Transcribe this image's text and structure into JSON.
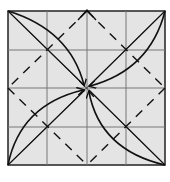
{
  "diagram": {
    "grid_divisions": 4,
    "paper_color": "#e4e4e4",
    "grid_color": "#6e6e6e",
    "line_color": "#111111",
    "elements": {
      "diagonals": [
        "top-left to bottom-right",
        "top-right to bottom-left"
      ],
      "valley_fold_diamond": "dashed lines connecting edge midpoints",
      "curved_arrows": [
        {
          "from": "top-left corner",
          "to": "center"
        },
        {
          "from": "top-right corner",
          "to": "center"
        },
        {
          "from": "bottom-left corner",
          "to": "center"
        },
        {
          "from": "bottom-right corner",
          "to": "center"
        }
      ],
      "top_marker": "chevron at top edge midpoint"
    }
  }
}
